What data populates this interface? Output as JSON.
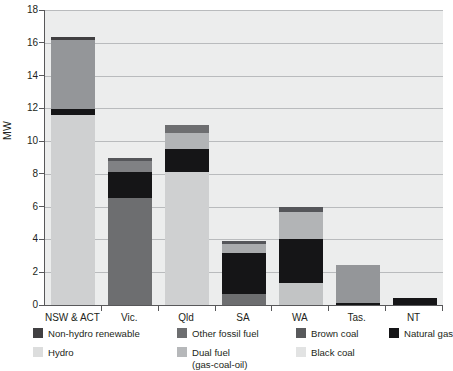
{
  "chart_data": {
    "type": "bar",
    "subtype": "stacked-vertical",
    "title": "",
    "xlabel": "",
    "ylabel": "MW",
    "ylim": [
      0,
      18
    ],
    "ytick_step": 2,
    "ytick_labels": [
      "0",
      "2",
      "4",
      "6",
      "8",
      "10",
      "12",
      "14",
      "16",
      "18"
    ],
    "grid": true,
    "grid_axis": "y",
    "legend_position": "below",
    "categories": [
      "NSW & ACT",
      "Vic.",
      "Qld",
      "SA",
      "WA",
      "Tas.",
      "NT"
    ],
    "series": [
      {
        "name": "Black coal",
        "color": "#cfd0d1",
        "values": [
          11.6,
          0,
          8.1,
          0,
          1.35,
          0,
          0
        ]
      },
      {
        "name": "Brown coal",
        "color": "#6d6e70",
        "values": [
          0,
          6.5,
          0,
          0.65,
          0,
          0,
          0
        ]
      },
      {
        "name": "Natural gas",
        "color": "#151517",
        "values": [
          0.35,
          1.6,
          1.4,
          2.55,
          2.65,
          0.12,
          0.45
        ]
      },
      {
        "name": "Hydro",
        "color": "#949699",
        "values": [
          4.25,
          0,
          1.0,
          0,
          1.7,
          2.33,
          0
        ]
      },
      {
        "name": "Dual fuel (gas-coal-oil)",
        "color": "#a9abad",
        "values": [
          0,
          0,
          0,
          0.55,
          0,
          0,
          0
        ]
      },
      {
        "name": "Other fossil fuel",
        "color": "#808184",
        "values": [
          0,
          0.9,
          0.5,
          0,
          0,
          0,
          0
        ]
      },
      {
        "name": "Non-hydro renewable",
        "color": "#414042",
        "values": [
          0.15,
          0,
          0,
          0.15,
          0.3,
          0,
          0
        ]
      }
    ],
    "bar_stacks": [
      {
        "category": "NSW & ACT",
        "total": 16.35,
        "segments": [
          {
            "name": "Black coal",
            "start": 0,
            "end": 11.6,
            "color": "#cfd0d1"
          },
          {
            "name": "Natural gas",
            "start": 11.6,
            "end": 11.95,
            "color": "#151517"
          },
          {
            "name": "Hydro",
            "start": 11.95,
            "end": 16.2,
            "color": "#949699"
          },
          {
            "name": "Non-hydro renewable",
            "start": 16.2,
            "end": 16.35,
            "color": "#414042"
          }
        ]
      },
      {
        "category": "Vic.",
        "total": 9.0,
        "segments": [
          {
            "name": "Brown coal",
            "start": 0,
            "end": 6.5,
            "color": "#6d6e70"
          },
          {
            "name": "Natural gas",
            "start": 6.5,
            "end": 8.1,
            "color": "#151517"
          },
          {
            "name": "Other fossil fuel",
            "start": 8.1,
            "end": 8.8,
            "color": "#808184"
          },
          {
            "name": "Non-hydro renewable",
            "start": 8.8,
            "end": 9.0,
            "color": "#55565a"
          }
        ]
      },
      {
        "category": "Qld",
        "total": 11.0,
        "segments": [
          {
            "name": "Black coal",
            "start": 0,
            "end": 8.1,
            "color": "#cfd0d1"
          },
          {
            "name": "Natural gas",
            "start": 8.1,
            "end": 9.5,
            "color": "#151517"
          },
          {
            "name": "Hydro",
            "start": 9.5,
            "end": 10.5,
            "color": "#b2b4b6"
          },
          {
            "name": "Other fossil fuel",
            "start": 10.5,
            "end": 11.0,
            "color": "#6d6e70"
          }
        ]
      },
      {
        "category": "SA",
        "total": 3.9,
        "segments": [
          {
            "name": "Brown coal",
            "start": 0,
            "end": 0.65,
            "color": "#6d6e70"
          },
          {
            "name": "Natural gas",
            "start": 0.65,
            "end": 3.2,
            "color": "#151517"
          },
          {
            "name": "Dual fuel (gas-coal-oil)",
            "start": 3.2,
            "end": 3.72,
            "color": "#a9abad"
          },
          {
            "name": "Non-hydro renewable",
            "start": 3.72,
            "end": 3.9,
            "color": "#55565a"
          }
        ]
      },
      {
        "category": "WA",
        "total": 6.0,
        "segments": [
          {
            "name": "Black coal",
            "start": 0,
            "end": 1.35,
            "color": "#c2c4c5"
          },
          {
            "name": "Natural gas",
            "start": 1.35,
            "end": 4.0,
            "color": "#151517"
          },
          {
            "name": "Hydro",
            "start": 4.0,
            "end": 5.65,
            "color": "#b2b4b6"
          },
          {
            "name": "Non-hydro renewable",
            "start": 5.65,
            "end": 6.0,
            "color": "#55565a"
          }
        ]
      },
      {
        "category": "Tas.",
        "total": 2.45,
        "segments": [
          {
            "name": "Natural gas",
            "start": 0,
            "end": 0.12,
            "color": "#151517"
          },
          {
            "name": "Hydro",
            "start": 0.12,
            "end": 2.45,
            "color": "#949699"
          }
        ]
      },
      {
        "category": "NT",
        "total": 0.45,
        "segments": [
          {
            "name": "Natural gas",
            "start": 0,
            "end": 0.45,
            "color": "#151517"
          }
        ]
      }
    ],
    "legend": [
      {
        "label": "Non-hydro renewable",
        "color": "#414042",
        "row": 0,
        "col": 0
      },
      {
        "label": "Other fossil fuel",
        "color": "#6d6e70",
        "row": 0,
        "col": 1
      },
      {
        "label": "Brown coal",
        "color": "#58595b",
        "row": 0,
        "col": 2
      },
      {
        "label": "Natural gas",
        "color": "#151517",
        "row": 0,
        "col": 3
      },
      {
        "label": "Hydro",
        "color": "#dcdddd",
        "row": 1,
        "col": 0
      },
      {
        "label": "Dual fuel",
        "sub": "(gas-coal-oil)",
        "color": "#b6b8ba",
        "row": 1,
        "col": 1
      },
      {
        "label": "Black coal",
        "color": "#e2e3e3",
        "row": 1,
        "col": 2
      }
    ]
  },
  "colors": {
    "plot_background": "#eceded",
    "gridline": "#b9bbbd",
    "axis": "#58585a",
    "text": "#231f20"
  }
}
